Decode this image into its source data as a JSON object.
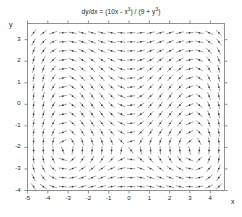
{
  "chart_data": {
    "type": "line",
    "plot_kind": "direction-field",
    "title_parts": {
      "lhs": "dy/dx = (10x - x",
      "exp1": "3",
      "mid": ") / (9 + y",
      "exp2": "3",
      "end": ")"
    },
    "equation": "dy/dx = (10x - x^3) / (9 + y^3)",
    "xlabel": "x",
    "ylabel": "y",
    "xlim": [
      -5.0,
      4.7
    ],
    "ylim": [
      -4.0,
      3.75
    ],
    "grid": false,
    "legend": null,
    "xticks": [
      -5,
      -4,
      -3,
      -2,
      -1,
      0,
      1,
      2,
      3,
      4
    ],
    "xtick_labels": [
      "-5",
      "-4",
      "-3",
      "-2",
      "-1",
      "0",
      "1",
      "2",
      "3",
      "4"
    ],
    "yticks": [
      3,
      2,
      1,
      0,
      -1,
      -2,
      -3,
      -4
    ],
    "ytick_labels": [
      "3",
      "2",
      "1",
      "0",
      "-1",
      "-2",
      "-3",
      "-4"
    ],
    "field": {
      "description": "slope field of short tangent segments with a dot marker at each sample point",
      "x_start": -4.7,
      "x_step": 0.48,
      "x_count": 20,
      "y_start": -3.82,
      "y_step": 0.42,
      "y_count": 19,
      "segment_length_px": 8.2,
      "dot_radius_px": 0.85,
      "stroke_color": "#555555",
      "dot_color": "#333333"
    },
    "critical_points": [
      {
        "type": "center",
        "x": -3.16,
        "y": -2.08
      },
      {
        "type": "saddle",
        "x": 0.0,
        "y": -2.08
      },
      {
        "type": "center",
        "x": 3.16,
        "y": -2.08
      }
    ],
    "axes_color": "#777777",
    "background": "#ffffff"
  },
  "figure": {
    "width": 242,
    "height": 217
  }
}
